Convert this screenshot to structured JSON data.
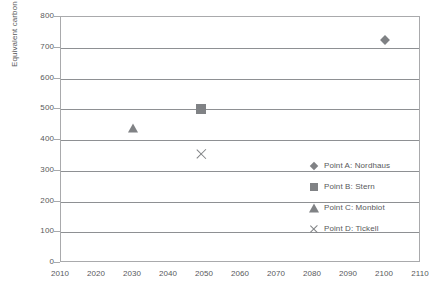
{
  "chart_data": {
    "type": "scatter",
    "title": "",
    "xlabel": "",
    "ylabel": "Equivalent carbon dioxide ppm",
    "xlim": [
      2010,
      2110
    ],
    "ylim": [
      0,
      800
    ],
    "grid": true,
    "legend_position": "inside-right",
    "x_ticks": [
      "2010",
      "2020",
      "2030",
      "2040",
      "2050",
      "2060",
      "2070",
      "2080",
      "2090",
      "2100",
      "2110"
    ],
    "x_tick_values": [
      2010,
      2020,
      2030,
      2040,
      2050,
      2060,
      2070,
      2080,
      2090,
      2100,
      2110
    ],
    "y_ticks": [
      "800",
      "700",
      "600",
      "500",
      "400",
      "300",
      "200",
      "100",
      "0"
    ],
    "y_tick_values": [
      800,
      700,
      600,
      500,
      400,
      300,
      200,
      100,
      0
    ],
    "series": [
      {
        "name": "Point A: Nordhaus",
        "marker": "diamond",
        "color": "#7f8184",
        "x": [
          2100
        ],
        "y": [
          725
        ]
      },
      {
        "name": "Point B: Stern",
        "marker": "square",
        "color": "#808285",
        "x": [
          2049
        ],
        "y": [
          500
        ]
      },
      {
        "name": "Point C: Monbiot",
        "marker": "triangle",
        "color": "#808285",
        "x": [
          2030
        ],
        "y": [
          440
        ]
      },
      {
        "name": "Point D: Tickell",
        "marker": "x",
        "color": "#808285",
        "x": [
          2049
        ],
        "y": [
          355
        ]
      }
    ]
  },
  "legend": {
    "entries": [
      {
        "label": "Point A: Nordhaus",
        "marker": "diamond"
      },
      {
        "label": "Point B: Stern",
        "marker": "square"
      },
      {
        "label": "Point C: Monbiot",
        "marker": "triangle"
      },
      {
        "label": "Point D: Tickell",
        "marker": "x"
      }
    ]
  },
  "colors": {
    "marker": "#808285",
    "gridline": "#8e9093",
    "axis": "#a9aaac",
    "text": "#58595b"
  }
}
